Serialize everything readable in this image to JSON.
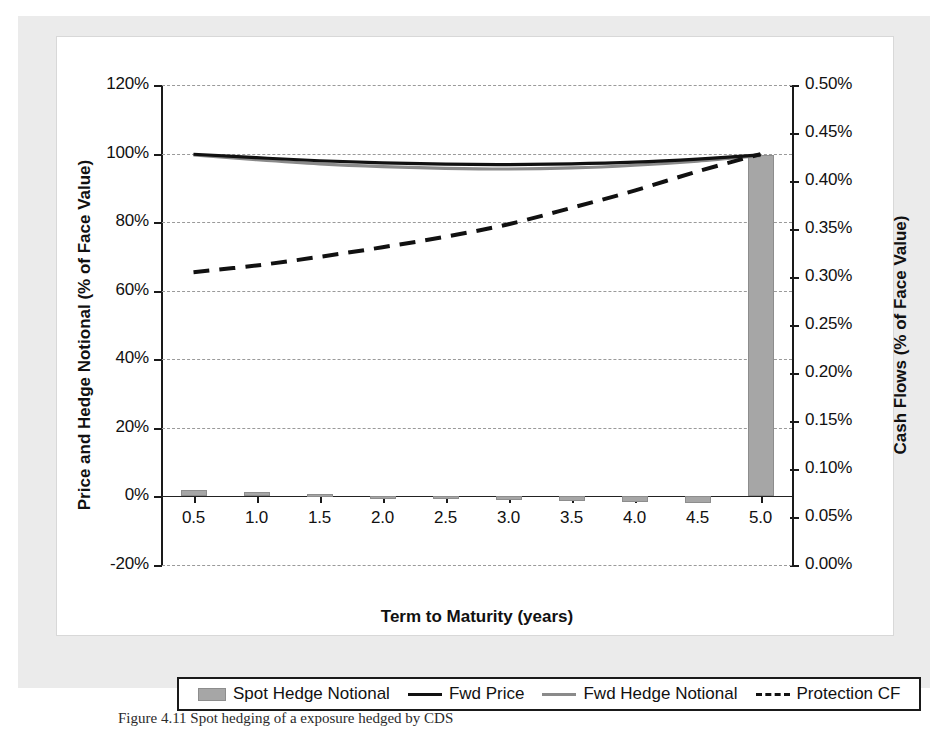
{
  "figure": {
    "caption": "Figure 4.11 Spot hedging of a exposure hedged by CDS"
  },
  "axes": {
    "left": {
      "title": "Price and Hedge Notional (% of Face Value)",
      "ticks": [
        "120%",
        "100%",
        "80%",
        "60%",
        "40%",
        "20%",
        "0%",
        "-20%"
      ],
      "min": -20,
      "max": 120
    },
    "right": {
      "title": "Cash Flows (% of Face Value)",
      "ticks": [
        "0.50%",
        "0.45%",
        "0.40%",
        "0.35%",
        "0.30%",
        "0.25%",
        "0.20%",
        "0.15%",
        "0.10%",
        "0.05%",
        "0.00%"
      ],
      "min": 0.0,
      "max": 0.5
    },
    "x": {
      "title": "Term to Maturity (years)",
      "ticks": [
        "0.5",
        "1.0",
        "1.5",
        "2.0",
        "2.5",
        "3.0",
        "3.5",
        "4.0",
        "4.5",
        "5.0"
      ],
      "min": 0.25,
      "max": 5.25
    }
  },
  "legend": {
    "items": [
      {
        "label": "Spot Hedge Notional",
        "marker": "bar-swatch",
        "color": "#a6a6a6"
      },
      {
        "label": "Fwd Price",
        "marker": "solid-line-black",
        "color": "#111111"
      },
      {
        "label": "Fwd Hedge Notional",
        "marker": "solid-line-gray",
        "color": "#8a8a8a"
      },
      {
        "label": "Protection CF",
        "marker": "dashed-line-black",
        "color": "#111111"
      }
    ]
  },
  "chart_data": {
    "type": "line",
    "title": "",
    "xlabel": "Term to Maturity (years)",
    "ylabel": "Price and Hedge Notional (% of Face Value)",
    "y2label": "Cash Flows (% of Face Value)",
    "xlim": [
      0.25,
      5.25
    ],
    "ylim": [
      -20,
      120
    ],
    "y2lim": [
      0.0,
      0.5
    ],
    "grid": true,
    "legend_position": "bottom-outside",
    "x": [
      0.5,
      1.0,
      1.5,
      2.0,
      2.5,
      3.0,
      3.5,
      4.0,
      4.5,
      5.0
    ],
    "series": [
      {
        "name": "Spot Hedge Notional",
        "type": "bar",
        "axis": "left",
        "unit": "% of Face Value",
        "values": [
          2.0,
          1.4,
          0.7,
          0.1,
          -0.4,
          -0.9,
          -1.3,
          -1.6,
          -1.8,
          99.5
        ]
      },
      {
        "name": "Fwd Price",
        "type": "line",
        "style": "solid",
        "color": "#111111",
        "axis": "left",
        "unit": "% of Face Value",
        "values": [
          99.8,
          98.8,
          97.9,
          97.3,
          96.9,
          96.8,
          97.0,
          97.5,
          98.4,
          99.6
        ]
      },
      {
        "name": "Fwd Hedge Notional",
        "type": "line",
        "style": "solid",
        "color": "#8a8a8a",
        "axis": "left",
        "unit": "% of Face Value",
        "values": [
          99.6,
          98.2,
          97.0,
          96.2,
          95.7,
          95.5,
          95.8,
          96.6,
          97.8,
          99.4
        ]
      },
      {
        "name": "Protection CF",
        "type": "line",
        "style": "dashed",
        "color": "#111111",
        "axis": "right",
        "unit": "% of Face Value",
        "values": [
          0.305,
          0.312,
          0.321,
          0.331,
          0.342,
          0.355,
          0.372,
          0.39,
          0.41,
          0.428
        ]
      }
    ]
  }
}
